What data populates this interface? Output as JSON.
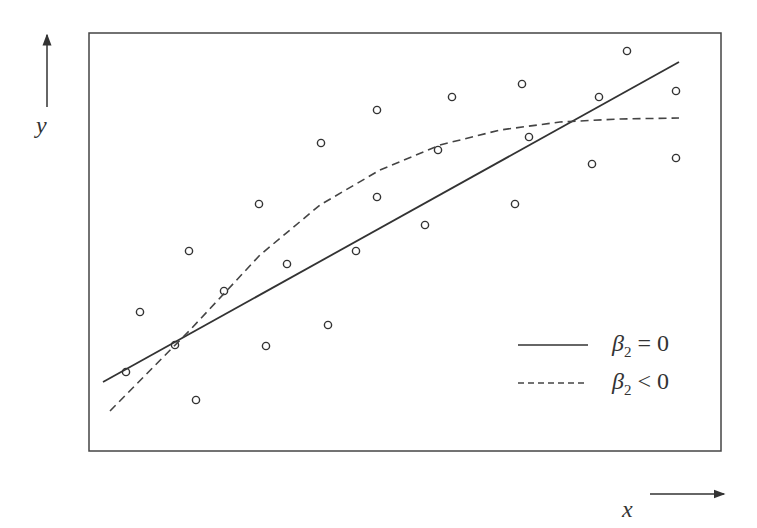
{
  "chart_data": {
    "type": "scatter",
    "title": "",
    "xlabel": "x",
    "ylabel": "y",
    "axes_style": "arrows outside framed plot area, no ticks",
    "grid": false,
    "legend_position": "lower right",
    "points": [
      {
        "x": 126,
        "y": 372
      },
      {
        "x": 140,
        "y": 312
      },
      {
        "x": 175,
        "y": 345
      },
      {
        "x": 189,
        "y": 251
      },
      {
        "x": 196,
        "y": 400
      },
      {
        "x": 224,
        "y": 291
      },
      {
        "x": 259,
        "y": 204
      },
      {
        "x": 266,
        "y": 346
      },
      {
        "x": 287,
        "y": 264
      },
      {
        "x": 321,
        "y": 143
      },
      {
        "x": 328,
        "y": 325
      },
      {
        "x": 356,
        "y": 251
      },
      {
        "x": 377,
        "y": 197
      },
      {
        "x": 377,
        "y": 110
      },
      {
        "x": 425,
        "y": 225
      },
      {
        "x": 438,
        "y": 150
      },
      {
        "x": 452,
        "y": 97
      },
      {
        "x": 515,
        "y": 204
      },
      {
        "x": 522,
        "y": 84
      },
      {
        "x": 529,
        "y": 137
      },
      {
        "x": 592,
        "y": 164
      },
      {
        "x": 599,
        "y": 97
      },
      {
        "x": 627,
        "y": 51
      },
      {
        "x": 676,
        "y": 91
      },
      {
        "x": 676,
        "y": 158
      }
    ],
    "series": [
      {
        "name": "β2 = 0",
        "style": "solid",
        "kind": "linear fit",
        "path": [
          [
            103,
            382
          ],
          [
            679,
            62
          ]
        ]
      },
      {
        "name": "β2 < 0",
        "style": "dashed",
        "kind": "quadratic fit (concave)",
        "path": [
          [
            110,
            411
          ],
          [
            190,
            330
          ],
          [
            260,
            255
          ],
          [
            320,
            205
          ],
          [
            380,
            170
          ],
          [
            440,
            145
          ],
          [
            500,
            130
          ],
          [
            560,
            122
          ],
          [
            620,
            119
          ],
          [
            679,
            118
          ]
        ]
      }
    ]
  },
  "labels": {
    "x_axis": "x",
    "y_axis": "y",
    "legend": [
      {
        "symbol": "β",
        "sub": "2",
        "relation": "= 0",
        "line": "solid"
      },
      {
        "symbol": "β",
        "sub": "2",
        "relation": "< 0",
        "line": "dashed"
      }
    ]
  },
  "colors": {
    "ink": "#333333",
    "frame": "#444444",
    "background": "#ffffff"
  }
}
